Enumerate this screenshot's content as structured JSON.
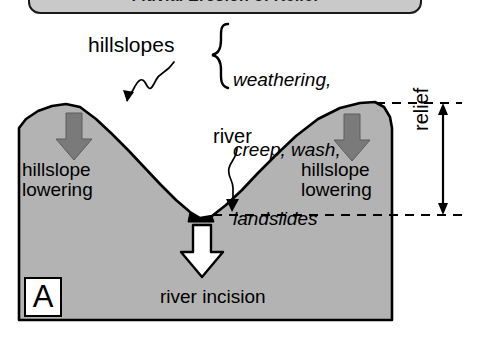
{
  "banner": {
    "title": "Fluvial Erosion of Relief"
  },
  "figure": {
    "panel_letter": "A",
    "hillslopes_label": "hillslopes",
    "process_list": [
      "weathering,",
      "creep, wash,",
      "landslides"
    ],
    "river_label": "river",
    "river_incision_label": "river incision",
    "relief_label": "relief",
    "left_hillslope_lowering": "hillslope\nlowering",
    "right_hillslope_lowering": "hillslope\nlowering"
  },
  "colors": {
    "banner_fill": "#c9c9c9",
    "terrain_fill": "#b3b3b3",
    "lowering_arrow": "#7a7a7a",
    "incision_arrow": "#ffffff",
    "channel": "#000000",
    "outline": "#000000"
  },
  "icons": {
    "left_lowering_arrow": "down-arrow-icon",
    "right_lowering_arrow": "down-arrow-icon",
    "incision_arrow": "down-arrow-outline-icon",
    "relief_arrow": "double-headed-vertical-arrow-icon",
    "hillslopes_pointer": "squiggle-pointer-icon",
    "river_pointer": "squiggle-pointer-icon",
    "brace": "curly-brace-icon"
  }
}
